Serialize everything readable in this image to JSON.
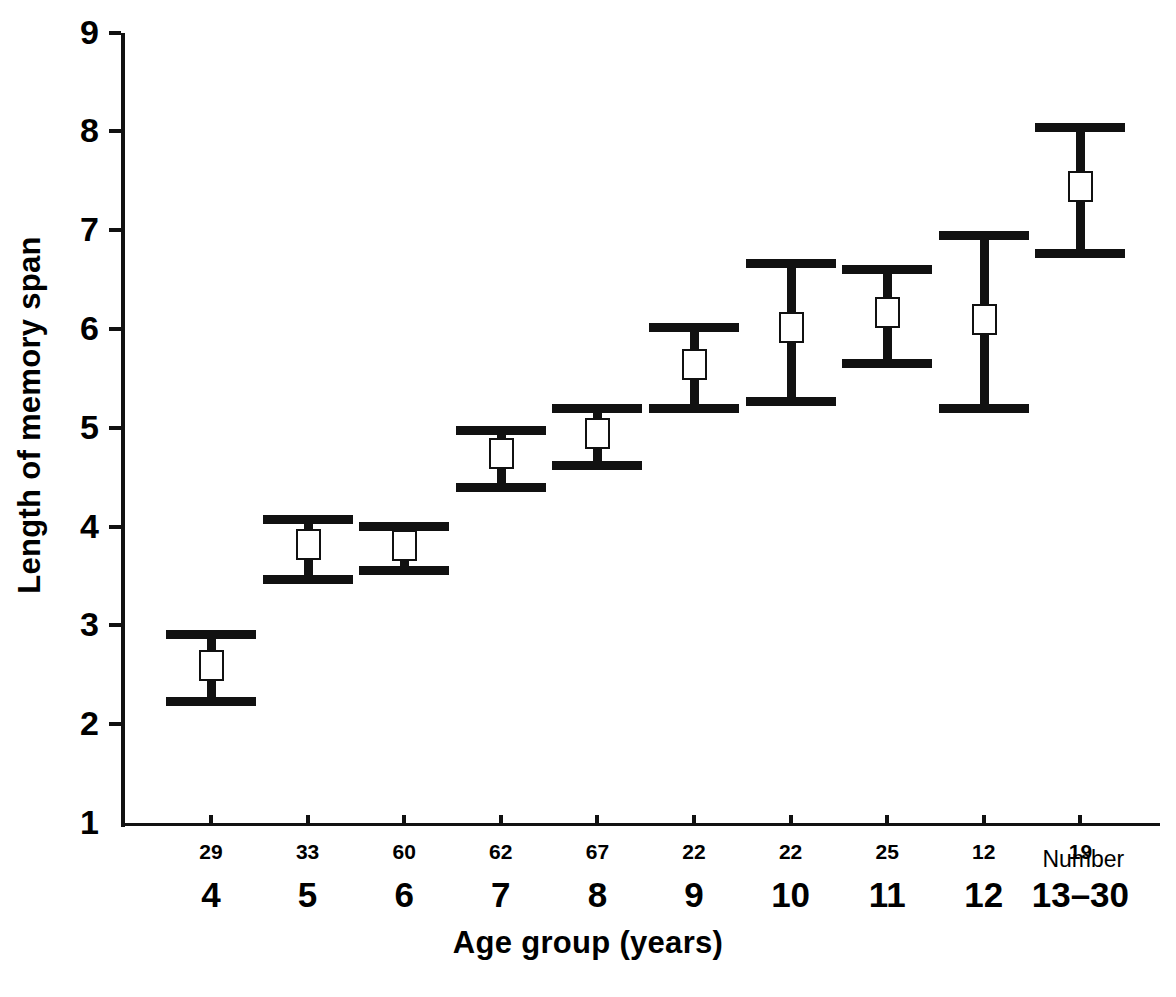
{
  "chart_data": {
    "type": "scatter",
    "title": "",
    "xlabel": "Age group (years)",
    "ylabel": "Length of memory span",
    "ylim": [
      1,
      9
    ],
    "yticks": [
      1,
      2,
      3,
      4,
      5,
      6,
      7,
      8,
      9
    ],
    "ytick_labels": [
      "1",
      "2",
      "3",
      "4",
      "5",
      "6",
      "7",
      "8",
      "9"
    ],
    "grid": false,
    "legend": false,
    "categories": [
      "4",
      "5",
      "6",
      "7",
      "8",
      "9",
      "10",
      "11",
      "12",
      "13–30"
    ],
    "secondary_axis_label": "Number",
    "counts": [
      29,
      33,
      60,
      62,
      67,
      22,
      22,
      25,
      12,
      19
    ],
    "series": [
      {
        "name": "Length of memory span",
        "values": [
          2.6,
          3.82,
          3.81,
          4.74,
          4.95,
          5.65,
          6.02,
          6.17,
          6.1,
          7.45
        ],
        "upper": [
          2.95,
          4.12,
          4.05,
          5.02,
          5.24,
          6.06,
          6.71,
          6.65,
          6.99,
          8.08
        ],
        "lower": [
          2.28,
          3.51,
          3.6,
          4.44,
          4.66,
          5.24,
          5.31,
          5.7,
          5.24,
          6.81
        ]
      }
    ],
    "marker": "open-square",
    "errorbar_style": "capped-range"
  },
  "axis": {
    "y_title": "Length of memory span",
    "x_title": "Age group (years)",
    "number_note": "Number"
  },
  "colors": {
    "ink": "#111111",
    "background": "#ffffff"
  }
}
